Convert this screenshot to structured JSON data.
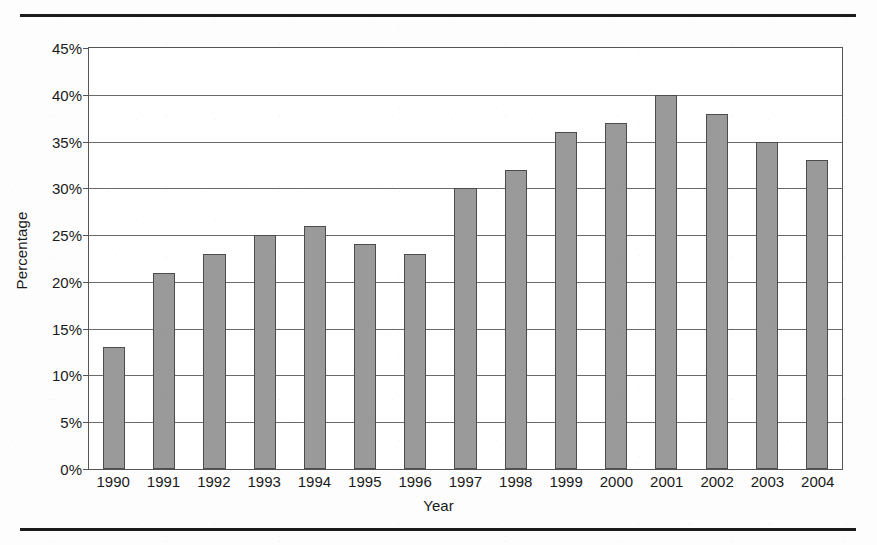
{
  "figure": {
    "rule_top": "horizontal-rule",
    "rule_bottom": "horizontal-rule"
  },
  "chart_data": {
    "type": "bar",
    "title": "",
    "xlabel": "Year",
    "ylabel": "Percentage",
    "categories": [
      "1990",
      "1991",
      "1992",
      "1993",
      "1994",
      "1995",
      "1996",
      "1997",
      "1998",
      "1999",
      "2000",
      "2001",
      "2002",
      "2003",
      "2004"
    ],
    "values": [
      13,
      21,
      23,
      25,
      26,
      24,
      23,
      30,
      32,
      36,
      37,
      40,
      38,
      35,
      33
    ],
    "value_labels": [
      "13%",
      "21%",
      "23%",
      "25%",
      "26%",
      "24%",
      "23%",
      "30%",
      "32%",
      "36%",
      "37%",
      "40%",
      "38%",
      "35%",
      "33%"
    ],
    "ylim": [
      0,
      45
    ],
    "ytick_values": [
      0,
      5,
      10,
      15,
      20,
      25,
      30,
      35,
      40,
      45
    ],
    "ytick_labels": [
      "0%",
      "5%",
      "10%",
      "15%",
      "20%",
      "25%",
      "30%",
      "35%",
      "40%",
      "45%"
    ],
    "grid": true,
    "legend": "none",
    "series_name": "Percentage",
    "bar_color": "#9a9a9a",
    "bar_edge_color": "#4c4c4c",
    "grid_color": "#6a6a6a",
    "frame_color": "#555555",
    "background_color": "#ffffff"
  }
}
